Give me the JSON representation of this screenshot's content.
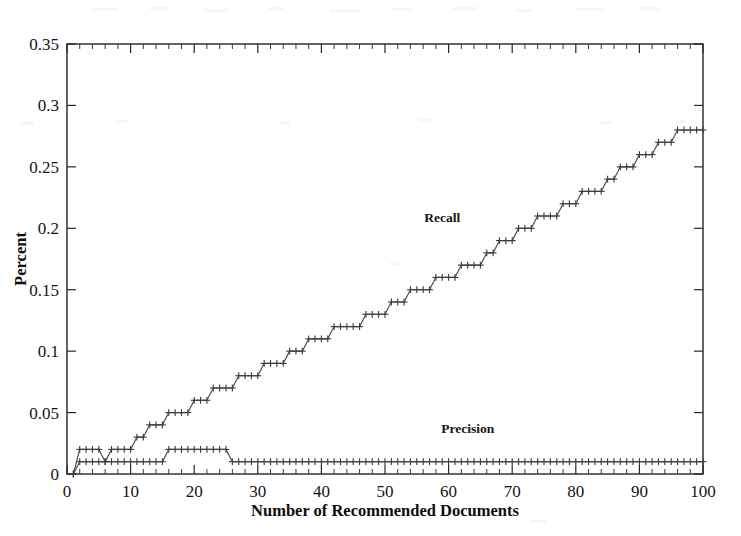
{
  "chart_data": {
    "type": "line",
    "title": "",
    "xlabel": "Number of Recommended Documents",
    "ylabel": "Percent",
    "xlim": [
      0,
      100
    ],
    "ylim": [
      0,
      0.35
    ],
    "xticks": [
      0,
      10,
      20,
      30,
      40,
      50,
      60,
      70,
      80,
      90,
      100
    ],
    "xtick_labels": [
      "0",
      "10",
      "20",
      "30",
      "40",
      "50",
      "60",
      "70",
      "80",
      "90",
      "100"
    ],
    "yticks": [
      0,
      0.05,
      0.1,
      0.15,
      0.2,
      0.25,
      0.3,
      0.35
    ],
    "ytick_labels": [
      "0",
      "0.05",
      "0.1",
      "0.15",
      "0.2",
      "0.25",
      "0.3",
      "0.35"
    ],
    "grid": false,
    "legend": "inline-annotations",
    "marker": "plus",
    "line_color": "#4a4a4a",
    "annotations": [
      {
        "text": "Recall",
        "x": 59,
        "y": 0.205
      },
      {
        "text": "Precision",
        "x": 63,
        "y": 0.033
      }
    ],
    "x": [
      1,
      2,
      3,
      4,
      5,
      6,
      7,
      8,
      9,
      10,
      11,
      12,
      13,
      14,
      15,
      16,
      17,
      18,
      19,
      20,
      21,
      22,
      23,
      24,
      25,
      26,
      27,
      28,
      29,
      30,
      31,
      32,
      33,
      34,
      35,
      36,
      37,
      38,
      39,
      40,
      41,
      42,
      43,
      44,
      45,
      46,
      47,
      48,
      49,
      50,
      51,
      52,
      53,
      54,
      55,
      56,
      57,
      58,
      59,
      60,
      61,
      62,
      63,
      64,
      65,
      66,
      67,
      68,
      69,
      70,
      71,
      72,
      73,
      74,
      75,
      76,
      77,
      78,
      79,
      80,
      81,
      82,
      83,
      84,
      85,
      86,
      87,
      88,
      89,
      90,
      91,
      92,
      93,
      94,
      95,
      96,
      97,
      98,
      99,
      100
    ],
    "series": [
      {
        "name": "Recall",
        "values": [
          0.0,
          0.02,
          0.02,
          0.02,
          0.02,
          0.01,
          0.02,
          0.02,
          0.02,
          0.02,
          0.03,
          0.03,
          0.04,
          0.04,
          0.04,
          0.05,
          0.05,
          0.05,
          0.05,
          0.06,
          0.06,
          0.06,
          0.07,
          0.07,
          0.07,
          0.07,
          0.08,
          0.08,
          0.08,
          0.08,
          0.09,
          0.09,
          0.09,
          0.09,
          0.1,
          0.1,
          0.1,
          0.11,
          0.11,
          0.11,
          0.11,
          0.12,
          0.12,
          0.12,
          0.12,
          0.12,
          0.13,
          0.13,
          0.13,
          0.13,
          0.14,
          0.14,
          0.14,
          0.15,
          0.15,
          0.15,
          0.15,
          0.16,
          0.16,
          0.16,
          0.16,
          0.17,
          0.17,
          0.17,
          0.17,
          0.18,
          0.18,
          0.19,
          0.19,
          0.19,
          0.2,
          0.2,
          0.2,
          0.21,
          0.21,
          0.21,
          0.21,
          0.22,
          0.22,
          0.22,
          0.23,
          0.23,
          0.23,
          0.23,
          0.24,
          0.24,
          0.25,
          0.25,
          0.25,
          0.26,
          0.26,
          0.26,
          0.27,
          0.27,
          0.27,
          0.28,
          0.28,
          0.28,
          0.28,
          0.28
        ]
      },
      {
        "name": "Precision",
        "values": [
          0.0,
          0.01,
          0.01,
          0.01,
          0.01,
          0.01,
          0.01,
          0.01,
          0.01,
          0.01,
          0.01,
          0.01,
          0.01,
          0.01,
          0.01,
          0.02,
          0.02,
          0.02,
          0.02,
          0.02,
          0.02,
          0.02,
          0.02,
          0.02,
          0.02,
          0.01,
          0.01,
          0.01,
          0.01,
          0.01,
          0.01,
          0.01,
          0.01,
          0.01,
          0.01,
          0.01,
          0.01,
          0.01,
          0.01,
          0.01,
          0.01,
          0.01,
          0.01,
          0.01,
          0.01,
          0.01,
          0.01,
          0.01,
          0.01,
          0.01,
          0.01,
          0.01,
          0.01,
          0.01,
          0.01,
          0.01,
          0.01,
          0.01,
          0.01,
          0.01,
          0.01,
          0.01,
          0.01,
          0.01,
          0.01,
          0.01,
          0.01,
          0.01,
          0.01,
          0.01,
          0.01,
          0.01,
          0.01,
          0.01,
          0.01,
          0.01,
          0.01,
          0.01,
          0.01,
          0.01,
          0.01,
          0.01,
          0.01,
          0.01,
          0.01,
          0.01,
          0.01,
          0.01,
          0.01,
          0.01,
          0.01,
          0.01,
          0.01,
          0.01,
          0.01,
          0.01,
          0.01,
          0.01,
          0.01,
          0.01
        ]
      }
    ]
  }
}
